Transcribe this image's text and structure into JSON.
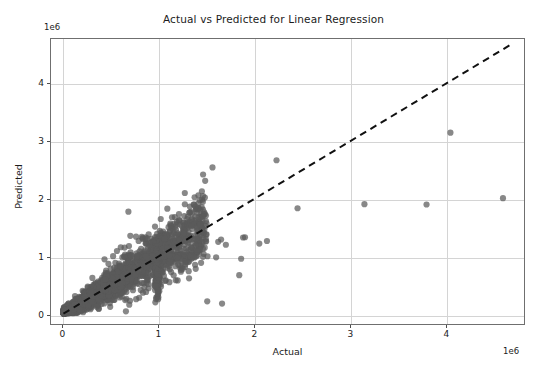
{
  "chart_data": {
    "type": "scatter",
    "title": "Actual vs Predicted for Linear Regression",
    "xlabel": "Actual",
    "ylabel": "Predicted",
    "x_exponent_label": "1e6",
    "y_exponent_label": "1e6",
    "exponent_scale": 1000000,
    "xlim": [
      -130000,
      4820000
    ],
    "ylim": [
      -180000,
      4780000
    ],
    "xticks": [
      0,
      1,
      2,
      3,
      4
    ],
    "yticks": [
      0,
      1,
      2,
      3,
      4
    ],
    "xtick_labels": [
      "0",
      "1",
      "2",
      "3",
      "4"
    ],
    "ytick_labels": [
      "0",
      "1",
      "2",
      "3",
      "4"
    ],
    "grid": true,
    "legend": null,
    "marker_color": "#5a5a5a",
    "marker_size": 5,
    "marker_opacity": 0.72,
    "reference_line": {
      "name": "identity-line",
      "style": "dashed",
      "color": "#111111",
      "width": 2,
      "x": [
        0,
        4700000
      ],
      "y": [
        0,
        4700000
      ]
    },
    "series": [
      {
        "name": "predictions",
        "note": "Dense heteroscedastic cone from origin plus sparse high-value outliers; units of 1e6.",
        "outlier_points": [
          [
            4600000,
            2010000
          ],
          [
            4050000,
            3150000
          ],
          [
            3800000,
            1900000
          ],
          [
            3150000,
            1905000
          ],
          [
            2450000,
            1835000
          ],
          [
            2230000,
            2670000
          ],
          [
            2130000,
            1265000
          ],
          [
            2050000,
            1220000
          ],
          [
            1900000,
            1330000
          ],
          [
            1880000,
            1325000
          ],
          [
            1860000,
            955000
          ],
          [
            1840000,
            670000
          ],
          [
            1700000,
            1200000
          ],
          [
            1660000,
            175000
          ],
          [
            1650000,
            1290000
          ],
          [
            1620000,
            1250000
          ],
          [
            1560000,
            2545000
          ],
          [
            1505000,
            215000
          ],
          [
            1480000,
            1735000
          ],
          [
            1460000,
            1700000
          ],
          [
            1430000,
            1560000
          ],
          [
            1390000,
            1300000
          ],
          [
            1360000,
            1545000
          ],
          [
            1340000,
            1525000
          ],
          [
            1300000,
            1230000
          ],
          [
            1270000,
            905000
          ],
          [
            1250000,
            780000
          ],
          [
            1210000,
            1180000
          ],
          [
            1170000,
            1140000
          ],
          [
            1120000,
            1540000
          ],
          [
            1100000,
            1505000
          ],
          [
            1080000,
            1360000
          ],
          [
            1060000,
            1305000
          ],
          [
            980000,
            1390000
          ],
          [
            940000,
            1245000
          ],
          [
            900000,
            1230000
          ],
          [
            860000,
            1330000
          ],
          [
            820000,
            1335000
          ],
          [
            760000,
            1340000
          ],
          [
            700000,
            1355000
          ],
          [
            680000,
            1775000
          ],
          [
            640000,
            1150000
          ],
          [
            600000,
            1155000
          ],
          [
            560000,
            1090000
          ],
          [
            520000,
            1000000
          ],
          [
            430000,
            945000
          ]
        ],
        "cone": {
          "description": "Main dense cluster: points fan out from (0,0) with spread growing with x",
          "x_range": [
            0,
            1500000
          ],
          "slope": 1.0,
          "count_approx": 1800
        }
      }
    ]
  },
  "axes": {
    "plot_left_px": 50,
    "plot_top_px": 38,
    "plot_width_px": 475,
    "plot_height_px": 287
  }
}
